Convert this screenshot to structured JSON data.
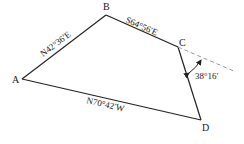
{
  "diagram": {
    "type": "traverse-polygon",
    "vertices": [
      {
        "id": "A",
        "label": "A",
        "x": 22,
        "y": 79
      },
      {
        "id": "B",
        "label": "B",
        "x": 106,
        "y": 15
      },
      {
        "id": "C",
        "label": "C",
        "x": 178,
        "y": 47
      },
      {
        "id": "D",
        "label": "D",
        "x": 201,
        "y": 120
      }
    ],
    "edges": [
      {
        "from": "A",
        "to": "B",
        "bearing": "N42°36′E"
      },
      {
        "from": "B",
        "to": "C",
        "bearing": "S64°56′E"
      },
      {
        "from": "C",
        "to": "D",
        "bearing": ""
      },
      {
        "from": "D",
        "to": "A",
        "bearing": "N70°42′W"
      }
    ],
    "deflection_angle": {
      "at": "C",
      "value": "38°16′"
    },
    "line_color": "#222222",
    "dash_color": "#999999"
  }
}
